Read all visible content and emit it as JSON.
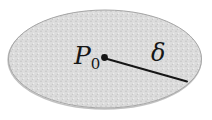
{
  "figure": {
    "labels": {
      "point_main": "P",
      "point_sub": "0",
      "radius": "δ"
    },
    "colors": {
      "background": "#ffffff",
      "disk_fill": "#dcdcdc",
      "disk_speckle_dark": "#c4c4c4",
      "disk_speckle_light": "#efefef",
      "disk_edge": "#a6a6a6",
      "disk_edge_shadow": "#8f8f8f",
      "ink": "#161616"
    }
  }
}
